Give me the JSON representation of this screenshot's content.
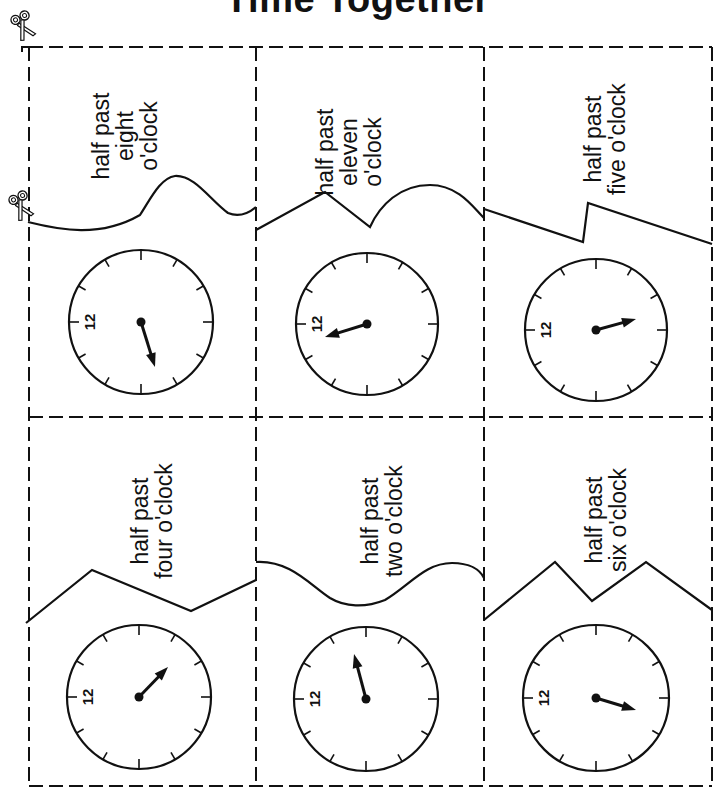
{
  "title": "Time Together",
  "icons": {
    "scissors_top": "scissors-icon",
    "scissors_mid": "scissors-icon"
  },
  "cards": [
    {
      "id": "c1",
      "lines": [
        "half past",
        "eight",
        "o'clock"
      ],
      "clock_label": "12",
      "hand": "half past eight"
    },
    {
      "id": "c2",
      "lines": [
        "half past",
        "eleven",
        "o'clock"
      ],
      "clock_label": "12",
      "hand": "half past eleven"
    },
    {
      "id": "c3",
      "lines": [
        "half past",
        "five o'clock"
      ],
      "clock_label": "12",
      "hand": "half past five"
    },
    {
      "id": "c4",
      "lines": [
        "half past",
        "four o'clock"
      ],
      "clock_label": "12",
      "hand": "half past four"
    },
    {
      "id": "c5",
      "lines": [
        "half past",
        "two o'clock"
      ],
      "clock_label": "12",
      "hand": "half past two"
    },
    {
      "id": "c6",
      "lines": [
        "half past",
        "six o'clock"
      ],
      "clock_label": "12",
      "hand": "half past six"
    }
  ]
}
